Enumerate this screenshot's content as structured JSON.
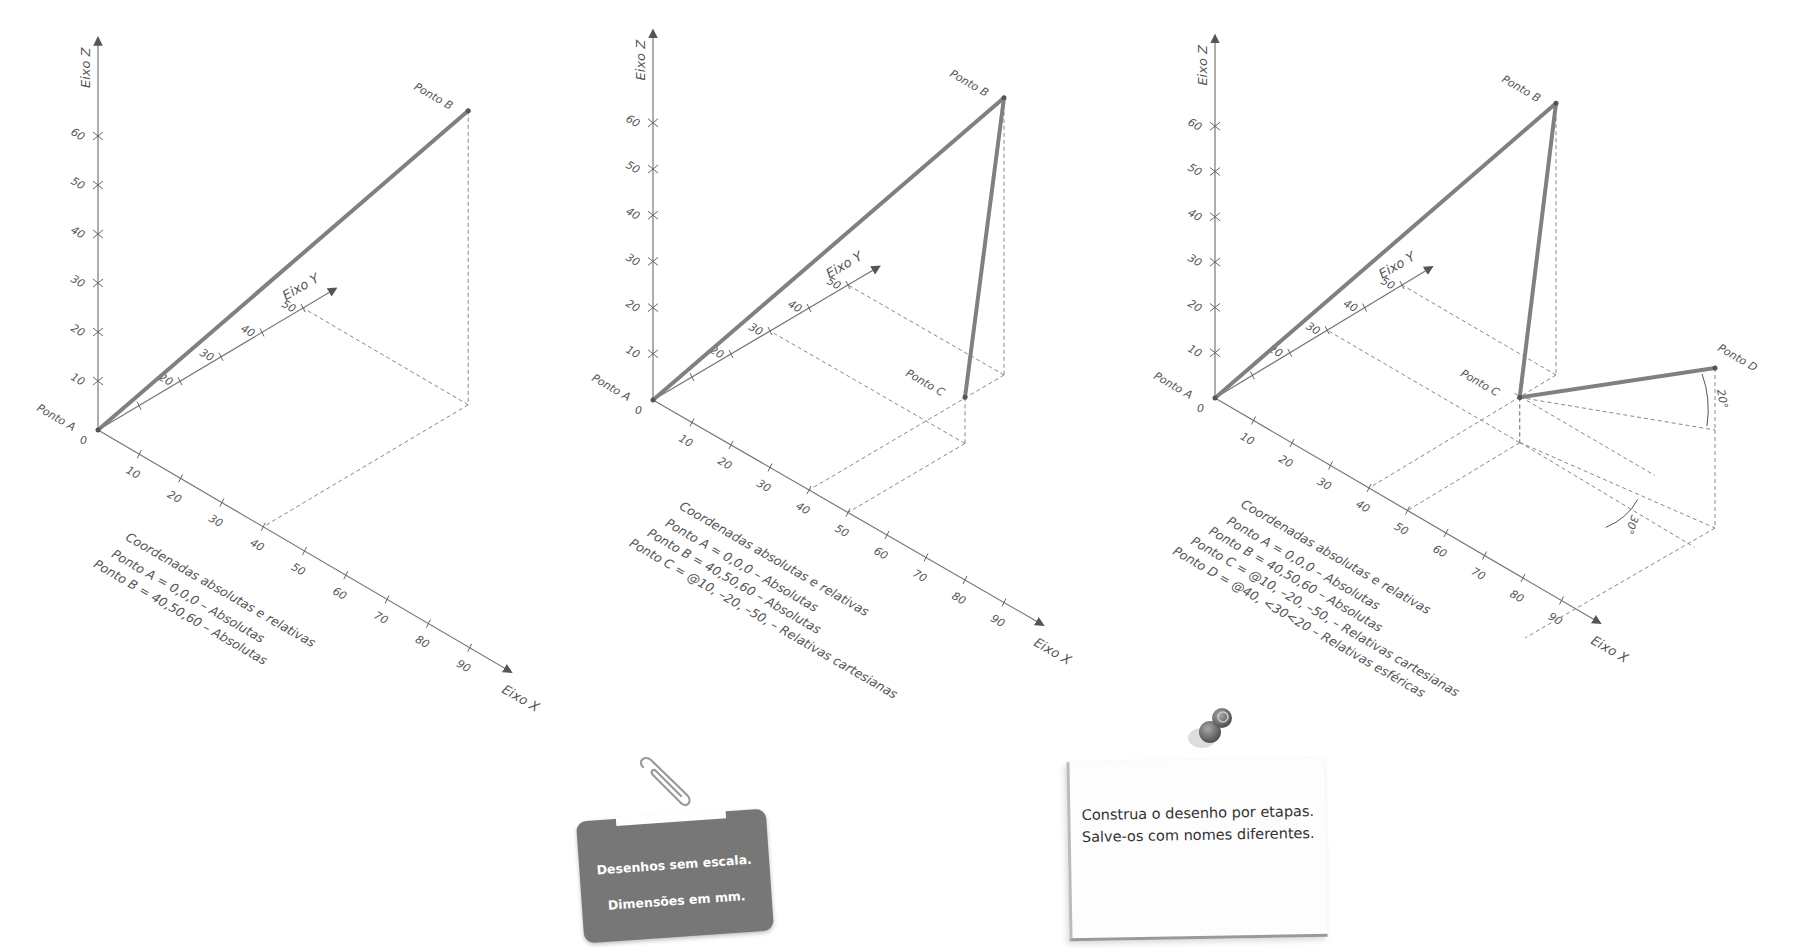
{
  "figures": [
    {
      "id": "fig1",
      "origin": [
        98,
        430
      ],
      "unit_x": [
        4.13,
        2.42
      ],
      "unit_y": [
        4.1,
        -2.44
      ],
      "unit_z": [
        0,
        -4.9
      ],
      "axis_labels": {
        "x": "Eixo X",
        "y": "Eixo Y",
        "z": "Eixo Z"
      },
      "x_ticks": [
        "10",
        "20",
        "30",
        "40",
        "50",
        "60",
        "70",
        "80",
        "90"
      ],
      "y_ticks": [
        "",
        "20",
        "30",
        "40",
        "50"
      ],
      "z_ticks": [
        "10",
        "20",
        "30",
        "40",
        "50",
        "60"
      ],
      "origin_label": "0",
      "points": [
        {
          "name": "Ponto A",
          "coord": [
            0,
            0,
            0
          ]
        },
        {
          "name": "Ponto B",
          "coord": [
            40,
            50,
            60
          ]
        }
      ],
      "caption": {
        "title": "Coordenadas absolutas e relativas",
        "lines": [
          "Ponto A = 0,0,0 – Absolutas",
          "Ponto B = 40,50,60 – Absolutas"
        ]
      }
    },
    {
      "id": "fig2",
      "origin": [
        653,
        400
      ],
      "unit_x": [
        3.9,
        2.25
      ],
      "unit_y": [
        3.9,
        -2.3
      ],
      "unit_z": [
        0,
        -4.62
      ],
      "axis_labels": {
        "x": "Eixo X",
        "y": "Eixo Y",
        "z": "Eixo Z"
      },
      "x_ticks": [
        "10",
        "20",
        "30",
        "40",
        "50",
        "60",
        "70",
        "80",
        "90"
      ],
      "y_ticks": [
        "",
        "20",
        "30",
        "40",
        "50"
      ],
      "z_ticks": [
        "10",
        "20",
        "30",
        "40",
        "50",
        "60"
      ],
      "origin_label": "0",
      "points": [
        {
          "name": "Ponto A",
          "coord": [
            0,
            0,
            0
          ]
        },
        {
          "name": "Ponto B",
          "coord": [
            40,
            50,
            60
          ]
        },
        {
          "name": "Ponto C",
          "coord": [
            50,
            30,
            10
          ]
        }
      ],
      "caption": {
        "title": "Coordenadas absolutas e relativas",
        "lines": [
          "Ponto A = 0,0,0 – Absolutas",
          "Ponto B = 40,50,60 – Absolutas",
          "Ponto C = @10, –20, –50, – Relativas cartesianas"
        ]
      }
    },
    {
      "id": "fig3",
      "origin": [
        1215,
        398
      ],
      "unit_x": [
        3.85,
        2.25
      ],
      "unit_y": [
        3.74,
        -2.26
      ],
      "unit_z": [
        0,
        -4.53
      ],
      "axis_labels": {
        "x": "Eixo X",
        "y": "Eixo Y",
        "z": "Eixo Z"
      },
      "x_ticks": [
        "10",
        "20",
        "30",
        "40",
        "50",
        "60",
        "70",
        "80",
        "90"
      ],
      "y_ticks": [
        "",
        "20",
        "30",
        "40",
        "50"
      ],
      "z_ticks": [
        "10",
        "20",
        "30",
        "40",
        "50",
        "60"
      ],
      "origin_label": "0",
      "points": [
        {
          "name": "Ponto A",
          "coord": [
            0,
            0,
            0
          ]
        },
        {
          "name": "Ponto B",
          "coord": [
            40,
            50,
            60
          ]
        },
        {
          "name": "Ponto C",
          "coord": [
            50,
            30,
            10
          ]
        },
        {
          "name": "Ponto D",
          "screen": [
            1715,
            368
          ]
        }
      ],
      "angles": {
        "elevation": "20°",
        "plan": "30°"
      },
      "caption": {
        "title": "Coordenadas absolutas e relativas",
        "lines": [
          "Ponto A = 0,0,0 – Absolutas",
          "Ponto B = 40,50,60 – Absolutas",
          "Ponto C = @10, –20, –50, – Relativas cartesianas",
          "Ponto D = @40, <30<20 – Relativas esféricas"
        ]
      }
    }
  ],
  "tag": {
    "line1": "Desenhos sem escala.",
    "line2": "Dimensões em mm."
  },
  "note": {
    "text": "Construa o desenho por etapas. Salve-os com nomes diferentes."
  },
  "colors": {
    "segment": "#808080",
    "axis": "#777777",
    "tag_bg": "#777777",
    "pin": "#666666"
  },
  "icons": {
    "clip": "paperclip-icon",
    "pin": "pushpin-icon"
  }
}
